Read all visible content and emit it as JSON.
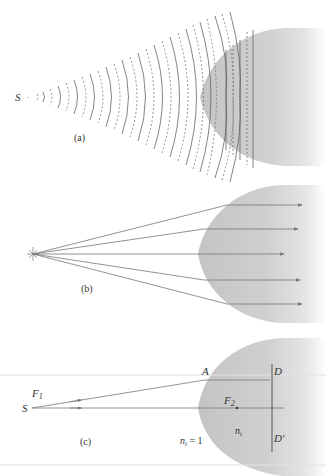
{
  "figure": {
    "panels": [
      {
        "id": "a",
        "caption": "(a)",
        "source_label": "S",
        "description": "Spherical wavefronts from point source S become plane wavefronts inside hyperbolic lens"
      },
      {
        "id": "b",
        "caption": "(b)",
        "description": "Rays diverging from point source are collimated into parallel rays by hyperbolic lens"
      },
      {
        "id": "c",
        "caption": "(c)",
        "labels": {
          "source": "S",
          "focus1": "F",
          "focus1_sub": "1",
          "focus2": "F",
          "focus2_sub": "2",
          "point_a": "A",
          "point_d": "D",
          "point_d_prime": "D′",
          "n_outside": "n",
          "n_outside_sub": "i",
          "n_outside_value": " = 1",
          "n_inside": "n",
          "n_inside_sub": "t"
        }
      }
    ],
    "colors": {
      "lens_fill": "#c8c8c8",
      "line": "#777777",
      "wave_line": "#666666",
      "text": "#333333"
    }
  }
}
